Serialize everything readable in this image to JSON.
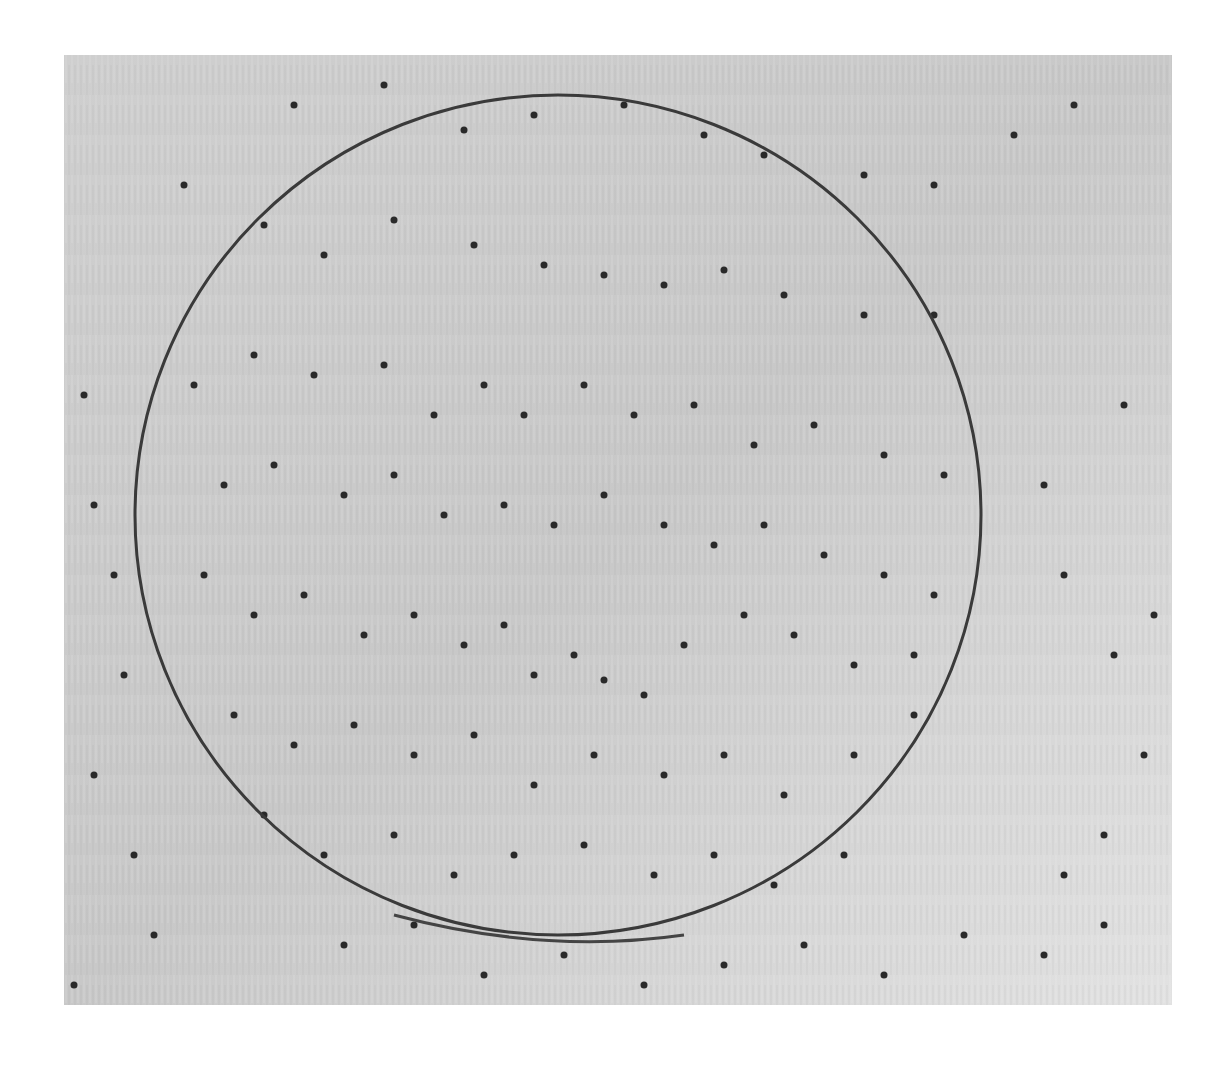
{
  "image": {
    "kind": "grayscale micrograph",
    "description": "Light brushed metallic surface with a thin circular scratch and scattered dark pits",
    "frame": {
      "x": 64,
      "y": 55,
      "width": 1108,
      "height": 950
    },
    "colors": {
      "background_page": "#ffffff",
      "surface_light": "#dcdcdc",
      "surface_mid": "#c4c4c4",
      "pit": "#2a2a2a",
      "scratch": "#3a3a3a"
    },
    "circle": {
      "cx": 494,
      "cy": 460,
      "rx": 423,
      "ry": 420
    },
    "pits": [
      [
        230,
        50
      ],
      [
        320,
        30
      ],
      [
        400,
        75
      ],
      [
        470,
        60
      ],
      [
        560,
        50
      ],
      [
        640,
        80
      ],
      [
        700,
        100
      ],
      [
        800,
        120
      ],
      [
        870,
        130
      ],
      [
        950,
        80
      ],
      [
        1010,
        50
      ],
      [
        120,
        130
      ],
      [
        200,
        170
      ],
      [
        260,
        200
      ],
      [
        330,
        165
      ],
      [
        410,
        190
      ],
      [
        480,
        210
      ],
      [
        540,
        220
      ],
      [
        600,
        230
      ],
      [
        660,
        215
      ],
      [
        720,
        240
      ],
      [
        800,
        260
      ],
      [
        870,
        260
      ],
      [
        130,
        330
      ],
      [
        190,
        300
      ],
      [
        250,
        320
      ],
      [
        320,
        310
      ],
      [
        370,
        360
      ],
      [
        420,
        330
      ],
      [
        460,
        360
      ],
      [
        520,
        330
      ],
      [
        570,
        360
      ],
      [
        630,
        350
      ],
      [
        690,
        390
      ],
      [
        750,
        370
      ],
      [
        820,
        400
      ],
      [
        880,
        420
      ],
      [
        160,
        430
      ],
      [
        210,
        410
      ],
      [
        280,
        440
      ],
      [
        330,
        420
      ],
      [
        380,
        460
      ],
      [
        440,
        450
      ],
      [
        490,
        470
      ],
      [
        540,
        440
      ],
      [
        600,
        470
      ],
      [
        650,
        490
      ],
      [
        700,
        470
      ],
      [
        760,
        500
      ],
      [
        820,
        520
      ],
      [
        870,
        540
      ],
      [
        140,
        520
      ],
      [
        190,
        560
      ],
      [
        240,
        540
      ],
      [
        300,
        580
      ],
      [
        350,
        560
      ],
      [
        400,
        590
      ],
      [
        440,
        570
      ],
      [
        470,
        620
      ],
      [
        510,
        600
      ],
      [
        540,
        625
      ],
      [
        580,
        640
      ],
      [
        620,
        590
      ],
      [
        680,
        560
      ],
      [
        730,
        580
      ],
      [
        790,
        610
      ],
      [
        850,
        600
      ],
      [
        170,
        660
      ],
      [
        230,
        690
      ],
      [
        290,
        670
      ],
      [
        350,
        700
      ],
      [
        410,
        680
      ],
      [
        470,
        730
      ],
      [
        530,
        700
      ],
      [
        600,
        720
      ],
      [
        660,
        700
      ],
      [
        720,
        740
      ],
      [
        790,
        700
      ],
      [
        850,
        660
      ],
      [
        200,
        760
      ],
      [
        260,
        800
      ],
      [
        330,
        780
      ],
      [
        390,
        820
      ],
      [
        450,
        800
      ],
      [
        520,
        790
      ],
      [
        590,
        820
      ],
      [
        650,
        800
      ],
      [
        710,
        830
      ],
      [
        780,
        800
      ],
      [
        280,
        890
      ],
      [
        350,
        870
      ],
      [
        420,
        920
      ],
      [
        500,
        900
      ],
      [
        580,
        930
      ],
      [
        660,
        910
      ],
      [
        740,
        890
      ],
      [
        820,
        920
      ],
      [
        900,
        880
      ],
      [
        980,
        900
      ],
      [
        1040,
        870
      ],
      [
        20,
        340
      ],
      [
        30,
        450
      ],
      [
        50,
        520
      ],
      [
        60,
        620
      ],
      [
        30,
        720
      ],
      [
        70,
        800
      ],
      [
        90,
        880
      ],
      [
        10,
        930
      ],
      [
        980,
        430
      ],
      [
        1000,
        520
      ],
      [
        1050,
        600
      ],
      [
        1080,
        700
      ],
      [
        1040,
        780
      ],
      [
        1000,
        820
      ],
      [
        1090,
        560
      ],
      [
        1060,
        350
      ]
    ]
  }
}
